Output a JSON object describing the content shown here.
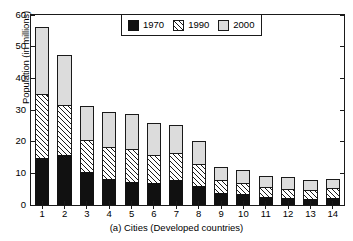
{
  "chart_data": {
    "type": "bar",
    "subtype": "stacked-vertical",
    "title": "",
    "caption": "(a) Cities (Developed countries)",
    "xlabel": "",
    "ylabel": "Population (in millions)",
    "categories": [
      "1",
      "2",
      "3",
      "4",
      "5",
      "6",
      "7",
      "8",
      "9",
      "10",
      "11",
      "12",
      "13",
      "14"
    ],
    "ylim": [
      0,
      60
    ],
    "yticks": [
      0,
      10,
      20,
      30,
      40,
      50,
      60
    ],
    "ytick_labels": [
      "0",
      "10",
      "20",
      "30",
      "40",
      "50",
      "60"
    ],
    "grid": false,
    "legend_position": "top-center",
    "stacked_totals": [
      56.3,
      47.4,
      31.3,
      29.3,
      28.9,
      26.0,
      25.3,
      20.1,
      12.1,
      11.2,
      9.3,
      8.8,
      8.0,
      8.3
    ],
    "series": [
      {
        "name": "1970",
        "color": "#111111",
        "pattern": "solid-black",
        "values": [
          14.9,
          15.9,
          10.3,
          8.2,
          7.2,
          6.8,
          8.0,
          6.1,
          3.8,
          3.4,
          2.5,
          2.1,
          1.9,
          2.2
        ]
      },
      {
        "name": "1990",
        "color": "#ffffff",
        "pattern": "diagonal-hatch",
        "values": [
          20.1,
          15.7,
          10.2,
          10.1,
          10.5,
          9.1,
          8.4,
          6.9,
          4.0,
          3.7,
          3.2,
          3.0,
          2.9,
          3.2
        ]
      },
      {
        "name": "2000",
        "color": "#dcdcdc",
        "pattern": "light-gray",
        "values": [
          21.3,
          15.8,
          10.8,
          11.0,
          11.2,
          10.1,
          8.9,
          7.1,
          4.3,
          4.1,
          3.6,
          3.7,
          3.2,
          2.9
        ]
      }
    ]
  },
  "legend": {
    "items": [
      {
        "label": "1970",
        "swatch": "swatch-black"
      },
      {
        "label": "1990",
        "swatch": "swatch-hatch"
      },
      {
        "label": "2000",
        "swatch": "swatch-gray"
      }
    ]
  }
}
